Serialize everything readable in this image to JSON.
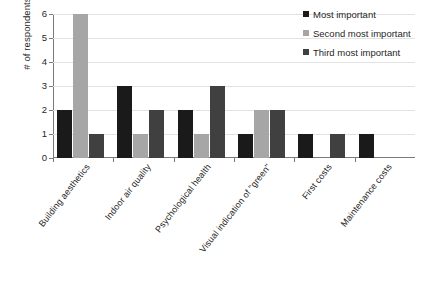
{
  "chart_data": {
    "type": "bar",
    "title": "",
    "xlabel": "",
    "ylabel": "# of respondents",
    "ylim": [
      0,
      6
    ],
    "yticks": [
      "0",
      "1",
      "2",
      "3",
      "4",
      "5",
      "6"
    ],
    "grid": true,
    "legend_position": "top-right",
    "categories": [
      "Building aesthetics",
      "Indoor air quality",
      "Psychological health",
      "Visual indication of \"green\"",
      "First costs",
      "Maintenance costs"
    ],
    "series": [
      {
        "name": "Most important",
        "color": "#1a1a1a",
        "values": [
          2,
          3,
          2,
          1,
          1,
          1
        ]
      },
      {
        "name": "Second most important",
        "color": "#a6a6a6",
        "values": [
          6,
          1,
          1,
          2,
          0,
          0
        ]
      },
      {
        "name": "Third most important",
        "color": "#404040",
        "values": [
          1,
          2,
          3,
          2,
          1,
          0
        ]
      }
    ]
  },
  "caption": {
    "text": ""
  }
}
